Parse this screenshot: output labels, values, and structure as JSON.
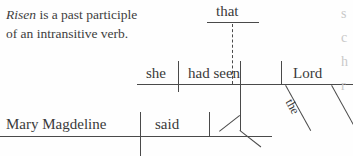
{
  "note": {
    "italic_word": "Risen",
    "rest_line1": " is a past participle",
    "line2": "of an intransitive verb."
  },
  "diagram": {
    "type": "reed-kellogg-sentence-diagram",
    "main_clause": {
      "subject": "Mary Magdeline",
      "verb": "said"
    },
    "object_clause": {
      "conjunction": "that",
      "subject": "she",
      "verb": "had seen",
      "object": "Lord",
      "article": "the"
    }
  },
  "edge_fragments": {
    "line1": "s",
    "line2": "c",
    "line3": "h",
    "line4": "r"
  }
}
